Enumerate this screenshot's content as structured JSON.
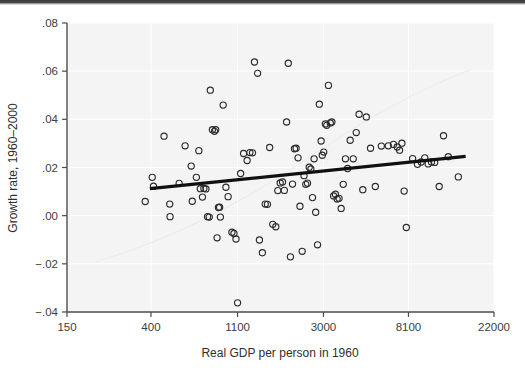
{
  "figure": {
    "background_color": "#ffffff",
    "panel_color": "#f4f4f4",
    "marker_color": "#2b2b2b",
    "fitline_color": "#111111"
  },
  "chart_data": {
    "type": "scatter",
    "title": "",
    "subtitle": "",
    "xlabel": "Real GDP per person in 1960",
    "ylabel": "Growth rate, 1960–2000",
    "xscale": "log",
    "yscale": "linear",
    "xticks": [
      150,
      400,
      1100,
      3000,
      8100,
      22000
    ],
    "xticklabels": [
      "150",
      "400",
      "1100",
      "3000",
      "8100",
      "22000"
    ],
    "yticks": [
      -0.04,
      -0.02,
      0.0,
      0.02,
      0.04,
      0.06,
      0.08
    ],
    "yticklabels": [
      "−.04",
      "−.02",
      ".00",
      ".02",
      ".04",
      ".06",
      ".08"
    ],
    "xlim": [
      150,
      22000
    ],
    "ylim": [
      -0.04,
      0.08
    ],
    "grid": true,
    "legend": false,
    "legend_position": "none",
    "annotations": [],
    "series": [
      {
        "name": "Countries",
        "marker": "open-circle",
        "points": [
          [
            374,
            0.0059
          ],
          [
            406,
            0.0159
          ],
          [
            412,
            0.0122
          ],
          [
            466,
            0.033
          ],
          [
            498,
            0.0048
          ],
          [
            500,
            -0.0004
          ],
          [
            556,
            0.0134
          ],
          [
            596,
            0.029
          ],
          [
            640,
            0.0206
          ],
          [
            648,
            0.006
          ],
          [
            680,
            0.0159
          ],
          [
            700,
            0.027
          ],
          [
            712,
            0.0112
          ],
          [
            730,
            0.0077
          ],
          [
            742,
            0.0113
          ],
          [
            760,
            0.0111
          ],
          [
            775,
            -0.0004
          ],
          [
            790,
            -0.0006
          ],
          [
            800,
            0.0521
          ],
          [
            820,
            0.0357
          ],
          [
            840,
            0.035
          ],
          [
            852,
            0.0357
          ],
          [
            866,
            -0.0092
          ],
          [
            880,
            0.0034
          ],
          [
            892,
            0.0035
          ],
          [
            900,
            -0.0006
          ],
          [
            930,
            0.0459
          ],
          [
            960,
            0.0118
          ],
          [
            985,
            0.0079
          ],
          [
            1030,
            -0.0069
          ],
          [
            1055,
            -0.0074
          ],
          [
            1080,
            -0.0097
          ],
          [
            1100,
            -0.0362
          ],
          [
            1140,
            0.0175
          ],
          [
            1180,
            0.0258
          ],
          [
            1230,
            0.0229
          ],
          [
            1270,
            0.0262
          ],
          [
            1310,
            0.0261
          ],
          [
            1340,
            0.0638
          ],
          [
            1390,
            0.0591
          ],
          [
            1420,
            -0.0101
          ],
          [
            1470,
            -0.0154
          ],
          [
            1520,
            0.0048
          ],
          [
            1560,
            0.0047
          ],
          [
            1600,
            0.0283
          ],
          [
            1660,
            -0.0036
          ],
          [
            1720,
            -0.0046
          ],
          [
            1760,
            0.0104
          ],
          [
            1810,
            0.0136
          ],
          [
            1860,
            0.014
          ],
          [
            1900,
            0.0105
          ],
          [
            1950,
            0.0389
          ],
          [
            1990,
            0.0633
          ],
          [
            2040,
            -0.0171
          ],
          [
            2090,
            0.0131
          ],
          [
            2140,
            0.0278
          ],
          [
            2180,
            0.028
          ],
          [
            2230,
            0.024
          ],
          [
            2280,
            0.0039
          ],
          [
            2340,
            -0.0148
          ],
          [
            2390,
            0.0166
          ],
          [
            2440,
            0.013
          ],
          [
            2490,
            0.0135
          ],
          [
            2540,
            0.0201
          ],
          [
            2590,
            0.0194
          ],
          [
            2640,
            0.0075
          ],
          [
            2690,
            0.0236
          ],
          [
            2740,
            0.0014
          ],
          [
            2800,
            -0.0121
          ],
          [
            2860,
            0.0463
          ],
          [
            2920,
            0.031
          ],
          [
            2960,
            0.0251
          ],
          [
            3010,
            0.0264
          ],
          [
            3070,
            0.0381
          ],
          [
            3120,
            0.0375
          ],
          [
            3180,
            0.0541
          ],
          [
            3250,
            0.0385
          ],
          [
            3310,
            0.0389
          ],
          [
            3380,
            0.0082
          ],
          [
            3450,
            0.0089
          ],
          [
            3520,
            0.0069
          ],
          [
            3600,
            0.0072
          ],
          [
            3690,
            0.003
          ],
          [
            3780,
            0.013
          ],
          [
            3880,
            0.0236
          ],
          [
            3980,
            0.0196
          ],
          [
            4100,
            0.0313
          ],
          [
            4250,
            0.0236
          ],
          [
            4400,
            0.0345
          ],
          [
            4550,
            0.0421
          ],
          [
            4750,
            0.0108
          ],
          [
            4950,
            0.041
          ],
          [
            5200,
            0.028
          ],
          [
            5500,
            0.0121
          ],
          [
            5900,
            0.0289
          ],
          [
            6400,
            0.029
          ],
          [
            6800,
            0.0296
          ],
          [
            7100,
            0.0285
          ],
          [
            7300,
            0.0272
          ],
          [
            7500,
            0.0301
          ],
          [
            7700,
            0.0102
          ],
          [
            7900,
            -0.0049
          ],
          [
            8500,
            0.0237
          ],
          [
            9000,
            0.0213
          ],
          [
            9400,
            0.0223
          ],
          [
            9800,
            0.024
          ],
          [
            10200,
            0.0215
          ],
          [
            10600,
            0.0223
          ],
          [
            11000,
            0.0221
          ],
          [
            11600,
            0.0121
          ],
          [
            12200,
            0.0332
          ],
          [
            12900,
            0.0245
          ],
          [
            14500,
            0.0161
          ]
        ]
      },
      {
        "name": "Fitted regression line",
        "type": "line",
        "endpoints": [
          [
            395,
            0.0112
          ],
          [
            15800,
            0.0246
          ]
        ],
        "slope_note": "weakly positive"
      }
    ]
  },
  "axes": {
    "x_title": "Real GDP per person in 1960",
    "y_title": "Growth rate, 1960–2000"
  }
}
